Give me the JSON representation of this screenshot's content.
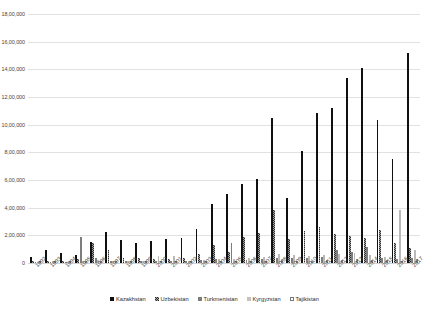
{
  "chart_data": {
    "type": "bar",
    "title": "",
    "xlabel": "",
    "ylabel": "",
    "ylim": [
      0,
      1800000
    ],
    "ytick_labels": [
      "18,00,000",
      "16,00,000",
      "14,00,000",
      "12,00,000",
      "10,00,000",
      "8,00,000",
      "6,00,000",
      "4,00,000",
      "2,00,000",
      "0"
    ],
    "ytick_values": [
      1800000,
      1600000,
      1400000,
      1200000,
      1000000,
      800000,
      600000,
      400000,
      200000,
      0
    ],
    "grid": true,
    "legend_position": "bottom",
    "categories": [
      "1992",
      "1993",
      "1994",
      "1995",
      "1996",
      "1997",
      "1998",
      "1999",
      "2000",
      "2001",
      "2002",
      "2003",
      "2004",
      "2005",
      "2006",
      "2007",
      "2008",
      "2009",
      "2010",
      "2011",
      "2012",
      "2013",
      "2014",
      "2015",
      "2016",
      "2017"
    ],
    "series": [
      {
        "name": "Kazakhstan",
        "color": "#101010",
        "fill": "solid",
        "values": [
          40000,
          95000,
          70000,
          58000,
          152000,
          222000,
          165000,
          143000,
          157000,
          170000,
          180000,
          245000,
          425000,
          500000,
          573000,
          605000,
          1050000,
          468000,
          812000,
          1088000,
          1118000,
          1335000,
          1408000,
          1032000,
          752000,
          1518000
        ]
      },
      {
        "name": "Uzbekistan",
        "color": "#2e2e2e",
        "fill": "checker",
        "values": [
          13000,
          18000,
          16000,
          26000,
          148000,
          92000,
          38000,
          33000,
          32000,
          30000,
          34000,
          68000,
          128000,
          80000,
          185000,
          215000,
          380000,
          172000,
          235000,
          262000,
          208000,
          192000,
          180000,
          238000,
          148000,
          112000
        ]
      },
      {
        "name": "Turkmenistan",
        "color": "#7d7d7d",
        "fill": "solid",
        "values": [
          6000,
          9000,
          8000,
          190000,
          36000,
          18000,
          14000,
          12000,
          12000,
          14000,
          16000,
          20000,
          26000,
          148000,
          22000,
          26000,
          38000,
          34000,
          36000,
          42000,
          96000,
          80000,
          118000,
          34000,
          30000,
          38000
        ]
      },
      {
        "name": "Kyrgyzstan",
        "color": "#b9b9b9",
        "fill": "solid",
        "values": [
          7000,
          12000,
          10000,
          14000,
          20000,
          16000,
          13000,
          12000,
          48000,
          52000,
          18000,
          24000,
          30000,
          28000,
          34000,
          40000,
          68000,
          56000,
          52000,
          60000,
          62000,
          76000,
          58000,
          46000,
          380000,
          96000
        ]
      },
      {
        "name": "Tajikistan",
        "color": "#ffffff",
        "fill": "hollow",
        "values": [
          3000,
          5000,
          4000,
          6000,
          8000,
          7000,
          6000,
          5000,
          6000,
          6000,
          7000,
          9000,
          11000,
          10000,
          12000,
          14000,
          20000,
          18000,
          17000,
          20000,
          22000,
          28000,
          24000,
          20000,
          18000,
          26000
        ]
      }
    ]
  },
  "legend": {
    "items": [
      {
        "label": "Kazakhstan"
      },
      {
        "label": "Uzbekistan"
      },
      {
        "label": "Turkmenistan"
      },
      {
        "label": "Kyrgyzstan"
      },
      {
        "label": "Tajikistan"
      }
    ]
  }
}
